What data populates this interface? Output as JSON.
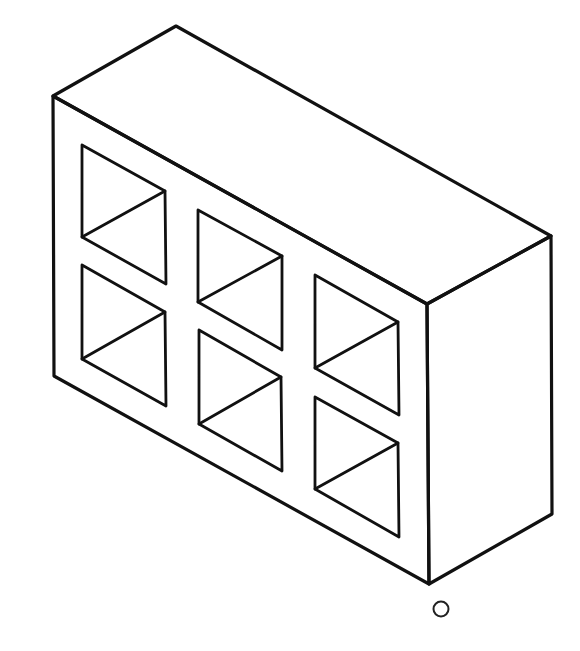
{
  "figure": {
    "stroke_color": "#111111",
    "background_color": "#ffffff",
    "label": "O"
  },
  "block": {
    "top_face": [
      [
        176,
        26
      ],
      [
        551,
        236
      ],
      [
        427,
        304
      ],
      [
        53,
        96
      ]
    ],
    "front_face": [
      [
        53,
        96
      ],
      [
        427,
        304
      ],
      [
        429,
        584
      ],
      [
        54,
        376
      ]
    ],
    "right_face": [
      [
        427,
        304
      ],
      [
        551,
        236
      ],
      [
        552,
        514
      ],
      [
        429,
        584
      ]
    ]
  },
  "holes": [
    {
      "id": 1,
      "row": 1,
      "col": 1,
      "corners": [
        [
          82,
          145
        ],
        [
          165,
          191
        ],
        [
          166,
          284
        ],
        [
          82,
          237
        ]
      ]
    },
    {
      "id": 2,
      "row": 1,
      "col": 2,
      "corners": [
        [
          198,
          210
        ],
        [
          282,
          256
        ],
        [
          282,
          350
        ],
        [
          198,
          302
        ]
      ]
    },
    {
      "id": 3,
      "row": 1,
      "col": 3,
      "corners": [
        [
          315,
          275
        ],
        [
          398,
          322
        ],
        [
          399,
          415
        ],
        [
          315,
          368
        ]
      ]
    },
    {
      "id": 4,
      "row": 2,
      "col": 1,
      "corners": [
        [
          82,
          265
        ],
        [
          165,
          312
        ],
        [
          166,
          406
        ],
        [
          82,
          359
        ]
      ]
    },
    {
      "id": 5,
      "row": 2,
      "col": 2,
      "corners": [
        [
          199,
          330
        ],
        [
          281,
          377
        ],
        [
          282,
          471
        ],
        [
          199,
          424
        ]
      ]
    },
    {
      "id": 6,
      "row": 2,
      "col": 3,
      "corners": [
        [
          315,
          397
        ],
        [
          398,
          443
        ],
        [
          399,
          537
        ],
        [
          315,
          489
        ]
      ]
    }
  ],
  "origin_marker": {
    "cx": 441,
    "cy": 609,
    "r": 7.5
  }
}
